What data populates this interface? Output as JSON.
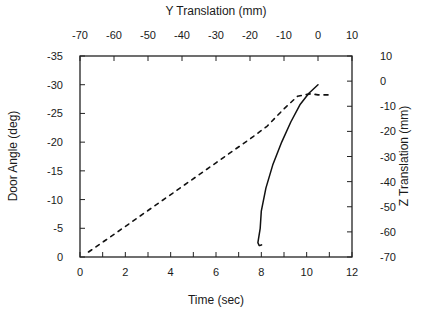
{
  "chart_data": {
    "type": "line",
    "title": "",
    "xlabel": "Time (sec)",
    "ylabel": "Door Angle (deg)",
    "x2label": "Y Translation (mm)",
    "y2label": "Z Translation (mm)",
    "xlim": [
      0,
      12
    ],
    "ylim": [
      0,
      -35
    ],
    "x2lim": [
      -70,
      10
    ],
    "y2lim": [
      -70,
      10
    ],
    "xticks": [
      0,
      2,
      4,
      6,
      8,
      10,
      12
    ],
    "yticks": [
      0,
      -5,
      -10,
      -15,
      -20,
      -25,
      -30,
      -35
    ],
    "x2ticks": [
      -70,
      -60,
      -50,
      -40,
      -30,
      -20,
      -10,
      0,
      10
    ],
    "y2ticks": [
      -70,
      -60,
      -50,
      -40,
      -30,
      -20,
      -10,
      0,
      10
    ],
    "grid": false,
    "legend": "none",
    "series": [
      {
        "name": "Door Angle",
        "style": "solid",
        "axes": "time-angle",
        "x": [
          7.9,
          7.85,
          7.95,
          8.0,
          8.2,
          8.5,
          8.9,
          9.3,
          9.7,
          10.1,
          10.5
        ],
        "y": [
          -2.0,
          -2.5,
          -5.0,
          -8.0,
          -12.0,
          -16.0,
          -20.0,
          -23.5,
          -26.5,
          -28.5,
          -30.0
        ]
      },
      {
        "name": "Y-Z Translation",
        "style": "dashed",
        "axes": "translation",
        "x": [
          -67.5,
          -60,
          -50,
          -40,
          -30,
          -20,
          -15,
          -10,
          -6,
          -2,
          0,
          3
        ],
        "y": [
          -68,
          -61,
          -51.5,
          -42,
          -32.5,
          -23,
          -18,
          -11,
          -6,
          -5,
          -5.5,
          -5.5
        ]
      }
    ]
  }
}
